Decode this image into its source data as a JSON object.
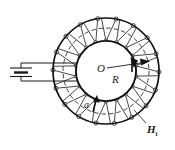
{
  "figure": {
    "background_color": "#ffffff",
    "stroke_color": "#1a1a1a",
    "dashed_color": "#2b2b2b",
    "width": 175,
    "height": 150
  },
  "labels": {
    "center_point": "O",
    "outer_radius": "R",
    "inner_radius_marker": "a",
    "field_symbol": "H",
    "field_subscript": "i"
  },
  "geometry": {
    "center_x": 106,
    "center_y": 71,
    "outer_circle_radius": 53,
    "dashed_circle_radius": 43,
    "inner_circle_radius": 30,
    "winding_count": 18,
    "node_marker_radius": 2.0
  },
  "circuit": {
    "battery_label": "",
    "battery_x": 20,
    "battery_y": 71,
    "lead_top_y": 63,
    "lead_bottom_y": 80,
    "lead_left_x": 36,
    "lead_right_x": 100
  },
  "annotations": {
    "field_arrow_direction": "clockwise-tangential-right",
    "radius_arrow_direction": "outward-right",
    "a_arrow_direction": "inward-up"
  },
  "chart_data": {
    "type": "diagram",
    "elements": [
      {
        "name": "outer-boundary-circle",
        "radius": 53,
        "style": "solid"
      },
      {
        "name": "mean-path-circle",
        "radius": 43,
        "style": "dashed"
      },
      {
        "name": "inner-bore-circle",
        "radius": 30,
        "style": "solid"
      },
      {
        "name": "winding-turns",
        "count": 18,
        "style": "solid-thin"
      },
      {
        "name": "battery-cell",
        "style": "two-plate"
      },
      {
        "name": "radius-arrow",
        "label": "R"
      },
      {
        "name": "thickness-arrow",
        "label": "a"
      },
      {
        "name": "field-vector",
        "label": "H_i"
      }
    ]
  }
}
